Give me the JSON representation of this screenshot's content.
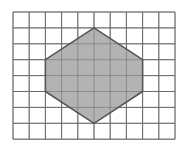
{
  "diagram": {
    "type": "grid-polygon",
    "grid": {
      "columns": 10,
      "rows": 8,
      "origin_px": [
        13,
        12
      ],
      "cell_w": 16.2,
      "cell_h": 15.9,
      "line_color": "#6b6b6b",
      "background": "#ffffff"
    },
    "shape": {
      "name": "hexagon",
      "vertices": [
        [
          5,
          1
        ],
        [
          8,
          3
        ],
        [
          8,
          5
        ],
        [
          5,
          7
        ],
        [
          2,
          5
        ],
        [
          2,
          3
        ]
      ],
      "fill": "#b3b3b3",
      "stroke": "#555555"
    }
  }
}
